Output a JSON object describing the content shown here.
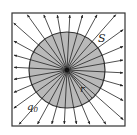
{
  "diagram": {
    "labels": {
      "surface": "S",
      "radius": "r",
      "charge": "q",
      "charge_subscript": "0"
    },
    "geometry": {
      "center": [
        67,
        70
      ],
      "sphere_radius": 38,
      "box": {
        "x": 12,
        "y": 13,
        "width": 113,
        "height": 113
      },
      "num_field_lines": 28
    },
    "colors": {
      "sphere_fill": "#b9b9b9",
      "sphere_stroke": "#333333",
      "line": "#222222",
      "box_stroke": "#333333",
      "background": "#ffffff"
    }
  }
}
